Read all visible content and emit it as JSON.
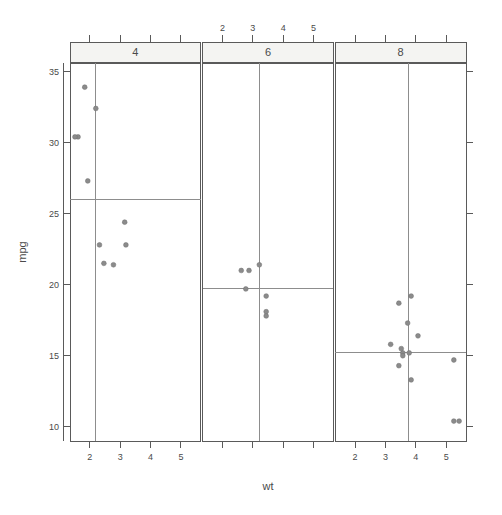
{
  "chart_data": {
    "type": "scatter",
    "title": "",
    "xlabel": "wt",
    "ylabel": "mpg",
    "xlim": [
      1.35,
      5.65
    ],
    "ylim": [
      9.0,
      35.6
    ],
    "grid": false,
    "legend": null,
    "conditioning_variable": "cyl",
    "panel_layout": "1 row x 3 columns",
    "x_ticks": [
      2,
      3,
      4,
      5
    ],
    "y_ticks": [
      10,
      15,
      20,
      25,
      30,
      35
    ],
    "x_tick_labels": [
      "2",
      "3",
      "4",
      "5"
    ],
    "y_tick_labels": [
      "10",
      "15",
      "20",
      "25",
      "30",
      "35"
    ],
    "reference_lines_note": "median crosshair lines per panel",
    "panels": [
      {
        "strip_label": "4",
        "bottom_axis_labeled": true,
        "top_axis_labeled": false,
        "ref_x": 2.2,
        "ref_y": 26.0,
        "points": [
          {
            "x": 1.835,
            "y": 33.9
          },
          {
            "x": 2.2,
            "y": 32.4
          },
          {
            "x": 1.615,
            "y": 30.4
          },
          {
            "x": 1.513,
            "y": 30.4
          },
          {
            "x": 1.935,
            "y": 27.3
          },
          {
            "x": 3.15,
            "y": 24.4
          },
          {
            "x": 2.32,
            "y": 22.8
          },
          {
            "x": 3.19,
            "y": 22.8
          },
          {
            "x": 2.465,
            "y": 21.5
          },
          {
            "x": 2.78,
            "y": 21.4
          }
        ]
      },
      {
        "strip_label": "6",
        "bottom_axis_labeled": false,
        "top_axis_labeled": true,
        "ref_x": 3.215,
        "ref_y": 19.7,
        "points": [
          {
            "x": 3.215,
            "y": 21.4
          },
          {
            "x": 2.62,
            "y": 21.0
          },
          {
            "x": 2.875,
            "y": 21.0
          },
          {
            "x": 3.44,
            "y": 19.2
          },
          {
            "x": 3.44,
            "y": 18.1
          },
          {
            "x": 3.44,
            "y": 17.8
          },
          {
            "x": 2.77,
            "y": 19.7
          }
        ]
      },
      {
        "strip_label": "8",
        "bottom_axis_labeled": true,
        "top_axis_labeled": false,
        "ref_x": 3.755,
        "ref_y": 15.2,
        "points": [
          {
            "x": 3.845,
            "y": 19.2
          },
          {
            "x": 3.44,
            "y": 18.7
          },
          {
            "x": 3.73,
            "y": 17.3
          },
          {
            "x": 4.07,
            "y": 16.4
          },
          {
            "x": 3.17,
            "y": 15.8
          },
          {
            "x": 3.57,
            "y": 15.2
          },
          {
            "x": 3.52,
            "y": 15.5
          },
          {
            "x": 3.78,
            "y": 15.2
          },
          {
            "x": 5.25,
            "y": 14.7
          },
          {
            "x": 3.44,
            "y": 14.3
          },
          {
            "x": 3.845,
            "y": 13.3
          },
          {
            "x": 5.25,
            "y": 10.4
          },
          {
            "x": 5.424,
            "y": 10.4
          },
          {
            "x": 3.57,
            "y": 15.0
          }
        ]
      }
    ]
  },
  "axes": {
    "x_title": "wt",
    "y_title": "mpg"
  },
  "colors": {
    "point": "#8b8b8b",
    "line": "#5a5a5a",
    "reference": "#8d8d8d",
    "strip_fill": "#f4f4f2",
    "background": "#ffffff"
  }
}
